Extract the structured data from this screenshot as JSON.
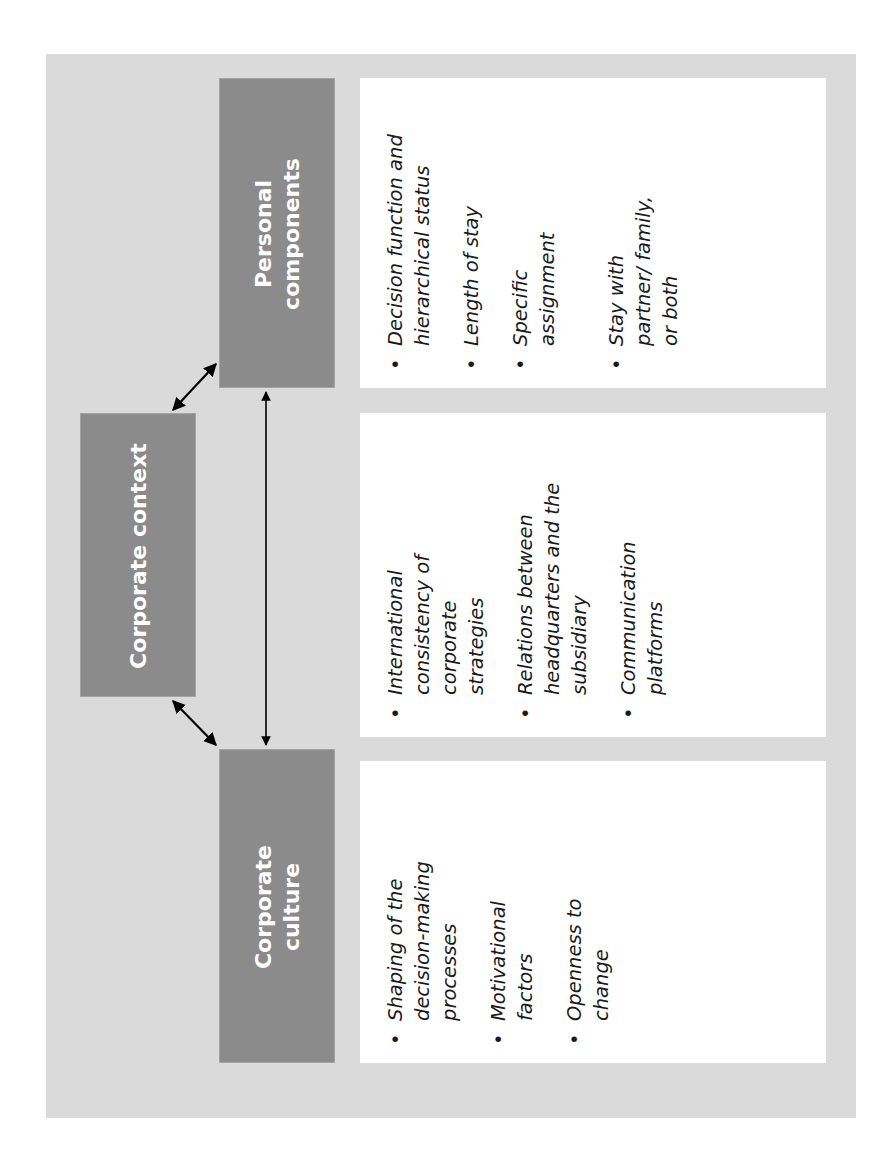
{
  "diagram": {
    "nodes": [
      {
        "id": "personal",
        "label": "Personal components"
      },
      {
        "id": "context",
        "label": "Corporate context"
      },
      {
        "id": "culture",
        "label": "Corporate culture"
      }
    ],
    "edges": [
      {
        "from": "context",
        "to": "personal",
        "type": "bidirectional"
      },
      {
        "from": "context",
        "to": "culture",
        "type": "bidirectional"
      },
      {
        "from": "personal",
        "to": "culture",
        "type": "bidirectional"
      }
    ],
    "personal": {
      "title": "Personal components",
      "items": [
        "Decision function and hierarchical status",
        "Length of stay",
        "Specific assignment",
        "Stay with partner/ family, or both"
      ]
    },
    "context": {
      "title": "Corporate context",
      "items": [
        "International consistency of corporate strategies",
        "Relations between headquarters and the subsidiary",
        "Communication platforms"
      ]
    },
    "culture": {
      "title": "Corporate culture",
      "items": [
        "Shaping of the decision-making processes",
        "Motivational factors",
        "Openness to change"
      ]
    },
    "bullet": "•",
    "colors": {
      "frame": "#dadada",
      "box": "#8b8b8b",
      "panel": "#ffffff",
      "text": "#1a1a1a",
      "arrow": "#000000"
    }
  }
}
